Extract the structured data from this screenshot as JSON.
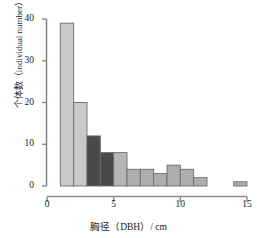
{
  "chart_data": {
    "type": "bar",
    "title": "",
    "subtitle": "",
    "xlabel": "胸径（DBH）/ cm",
    "ylabel": "个体数（individual number）",
    "xlim": [
      0,
      15
    ],
    "ylim": [
      0,
      40
    ],
    "grid": false,
    "legend": "none",
    "bin_width": 1,
    "xticks": [
      0,
      5,
      10,
      15
    ],
    "xtick_labels": [
      "0",
      "5",
      "10",
      "15"
    ],
    "yticks": [
      0,
      10,
      20,
      30,
      40
    ],
    "ytick_labels": [
      "0",
      "10",
      "20",
      "30",
      "40"
    ],
    "categories": [
      "1-2",
      "2-3",
      "3-4",
      "4-5",
      "5-6",
      "6-7",
      "7-8",
      "8-9",
      "9-10",
      "10-11",
      "11-12",
      "14-15"
    ],
    "bin_starts": [
      1,
      2,
      3,
      4,
      5,
      6,
      7,
      8,
      9,
      10,
      11,
      14
    ],
    "values": [
      39,
      20,
      12,
      8,
      8,
      4,
      4,
      3,
      5,
      4,
      2,
      1
    ],
    "bar_colors": [
      "#c9c9c9",
      "#c9c9c9",
      "#4a4a4a",
      "#4a4a4a",
      "#b5b5b5",
      "#adadad",
      "#adadad",
      "#adadad",
      "#adadad",
      "#adadad",
      "#adadad",
      "#adadad"
    ],
    "bar_edge_color": "#6e6e6e",
    "axis_color": "#8a8a8a"
  },
  "axes": {
    "y_axis_name": "y-axis",
    "x_axis_name": "x-axis"
  },
  "colors": {
    "background": "#ffffff",
    "text": "#222222",
    "light_bar": "#c9c9c9",
    "dark_bar": "#4a4a4a",
    "mid_bar": "#adadad",
    "axis": "#8a8a8a"
  }
}
